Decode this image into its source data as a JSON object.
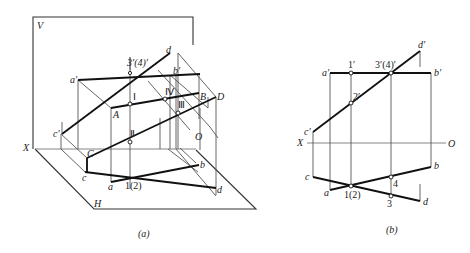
{
  "figure_a": {
    "caption": "(a)",
    "planes": {
      "vertical": "V",
      "horizontal": "H"
    },
    "axis": {
      "x": "X",
      "origin": "O"
    },
    "labels_roman": {
      "I": "Ⅰ",
      "II": "Ⅱ",
      "III": "Ⅲ",
      "IV": "Ⅳ"
    },
    "labels_space": {
      "A": "A",
      "B": "B",
      "C": "C",
      "D": "D"
    },
    "labels_v": {
      "a": "a′",
      "b": "b′",
      "c": "c′",
      "d": "d",
      "p34": "3′(4)′"
    },
    "labels_h": {
      "a": "a",
      "b": "b",
      "c": "c",
      "d": "d",
      "p12": "1(2)"
    }
  },
  "figure_b": {
    "caption": "(b)",
    "axis": {
      "x": "X",
      "origin": "O"
    },
    "labels_v": {
      "a": "a′",
      "b": "b′",
      "c": "c′",
      "d": "d′",
      "p1": "1′",
      "p2": "2′",
      "p34": "3′(4)′"
    },
    "labels_h": {
      "a": "a",
      "b": "b",
      "c": "c",
      "d": "d",
      "p12": "1(2)",
      "p3": "3",
      "p4": "4"
    }
  }
}
